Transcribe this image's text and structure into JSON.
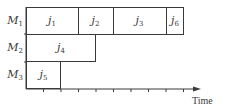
{
  "diagram": {
    "type": "gantt",
    "axis_label": "Time",
    "time_units": 10,
    "machines": [
      {
        "name": "M",
        "index": "1",
        "jobs": [
          {
            "name": "j",
            "index": "1",
            "start": 0,
            "end": 3
          },
          {
            "name": "j",
            "index": "2",
            "start": 3,
            "end": 5
          },
          {
            "name": "j",
            "index": "3",
            "start": 5,
            "end": 8
          },
          {
            "name": "j",
            "index": "6",
            "start": 8,
            "end": 9
          }
        ]
      },
      {
        "name": "M",
        "index": "2",
        "jobs": [
          {
            "name": "j",
            "index": "4",
            "start": 0,
            "end": 4
          }
        ]
      },
      {
        "name": "M",
        "index": "3",
        "jobs": [
          {
            "name": "j",
            "index": "5",
            "start": 0,
            "end": 2
          }
        ]
      }
    ],
    "colors": {
      "line": "#3a3a3a",
      "box_fill": "#ffffff"
    }
  }
}
